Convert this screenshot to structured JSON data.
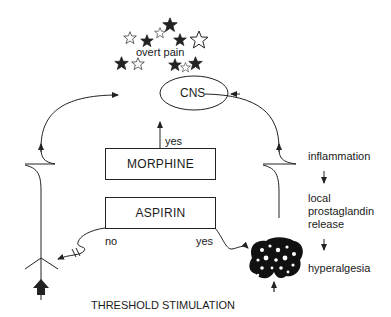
{
  "diagram": {
    "top_label": "overt pain",
    "cns_label": "CNS",
    "morphine_label": "MORPHINE",
    "aspirin_label": "ASPIRIN",
    "yes_morphine": "yes",
    "no_aspirin": "no",
    "yes_aspirin": "yes",
    "bottom_label": "THRESHOLD STIMULATION",
    "cascade": {
      "step1": "inflammation",
      "step2_line1": "local",
      "step2_line2": "prostaglandin",
      "step2_line3": "release",
      "step3": "hyperalgesia"
    },
    "icons": [
      "star-cluster-icon",
      "nerve-ending-icon",
      "stimulus-arrow-icon",
      "inflamed-tissue-icon"
    ]
  }
}
